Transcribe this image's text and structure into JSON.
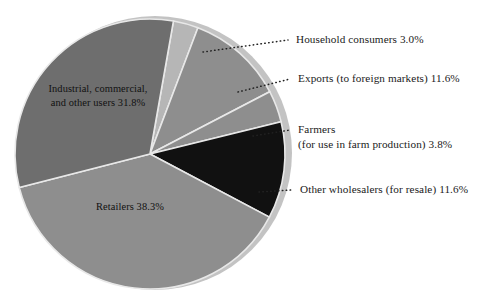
{
  "chart_data": {
    "type": "pie",
    "title": "",
    "subtitle": "",
    "xlabel": "",
    "ylabel": "",
    "legend_position": "callouts",
    "grid": false,
    "total_percent": 100.1,
    "categories": [
      "Household consumers",
      "Exports (to foreign markets)",
      "Farmers (for use in farm production)",
      "Other wholesalers (for resale)",
      "Retailers",
      "Industrial, commercial, and other users"
    ],
    "values": [
      3.0,
      11.6,
      3.8,
      11.6,
      38.3,
      31.8
    ],
    "slices": [
      {
        "name": "household-consumers",
        "label": "Household consumers",
        "value_text": "3.0%",
        "value": 3.0,
        "color": "#b6b6b6",
        "label_placement": "callout"
      },
      {
        "name": "exports",
        "label": "Exports (to foreign markets)",
        "value_text": "11.6%",
        "value": 11.6,
        "color": "#8e8e8e",
        "label_placement": "callout"
      },
      {
        "name": "farmers",
        "label": "Farmers",
        "label_line2": "(for use in farm production) 3.8%",
        "value_text": "3.8%",
        "value": 3.8,
        "color": "#8e8e8e",
        "label_placement": "callout"
      },
      {
        "name": "other-wholesalers",
        "label": "Other wholesalers (for resale)",
        "value_text": "11.6%",
        "value": 11.6,
        "color": "#111111",
        "label_placement": "callout"
      },
      {
        "name": "retailers",
        "label": "Retailers",
        "value_text": "38.3%",
        "value": 38.3,
        "color": "#8e8e8e",
        "label_placement": "inside"
      },
      {
        "name": "industrial-commercial",
        "label": "Industrial, commercial,",
        "label_line2": "and other users 31.8%",
        "value_text": "31.8%",
        "value": 31.8,
        "color": "#6e6e6e",
        "label_placement": "inside"
      }
    ]
  },
  "callouts": {
    "household": {
      "line1": "Household consumers 3.0%"
    },
    "exports": {
      "line1": "Exports (to foreign markets) 11.6%"
    },
    "farmers": {
      "line1": "Farmers",
      "line2": "(for use in farm production) 3.8%"
    },
    "wholesalers": {
      "line1": "Other wholesalers (for resale) 11.6%"
    }
  },
  "inside_labels": {
    "industrial": {
      "line1": "Industrial, commercial,",
      "line2": "and other users 31.8%"
    },
    "retailers": {
      "line1": "Retailers 38.3%"
    }
  },
  "colors": {
    "background": "#ffffff",
    "rim": "#c3c3c3",
    "dark_gray": "#6e6e6e",
    "mid_gray": "#8e8e8e",
    "light_gray": "#b6b6b6",
    "black_slice": "#111111",
    "separator": "#e8e8e8",
    "text": "#1a1a1a",
    "leader": "#222222"
  }
}
